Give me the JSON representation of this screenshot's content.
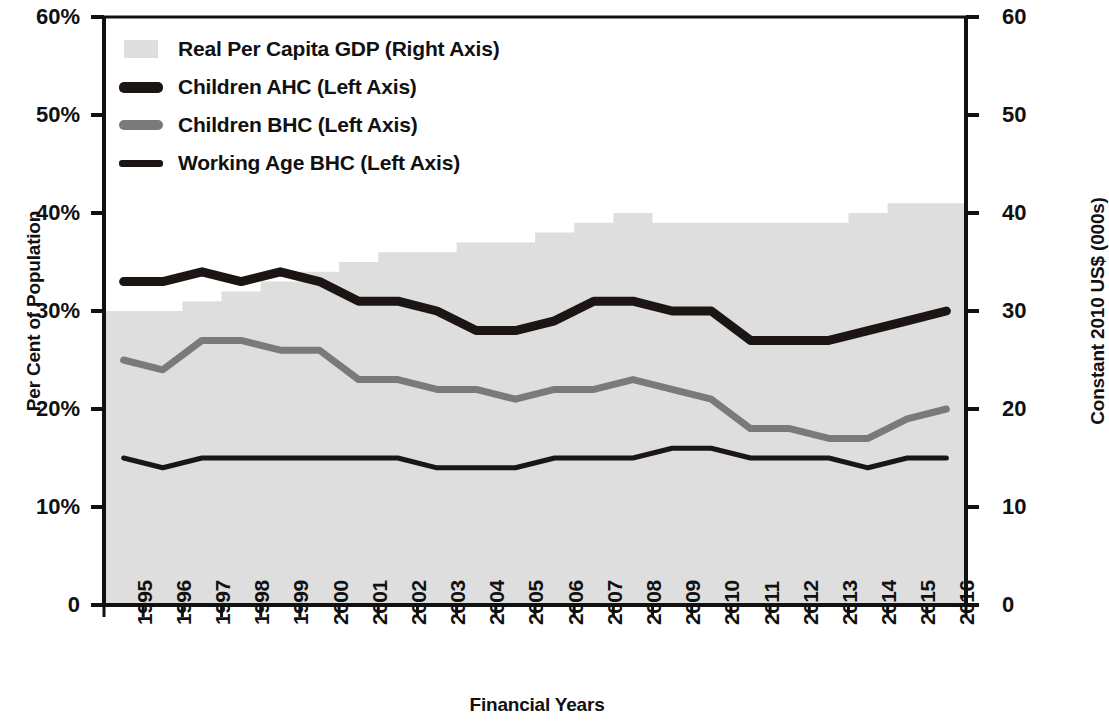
{
  "chart_data": {
    "type": "line",
    "title": "",
    "xlabel": "Financial Years",
    "ylabel": "Per Cent of Population",
    "y2label": "Constant 2010 US$ (000s)",
    "ylim": [
      0,
      60
    ],
    "y2lim": [
      0,
      60
    ],
    "grid": false,
    "legend_position": "top-left",
    "y_ticks": [
      "0",
      "10%",
      "20%",
      "30%",
      "40%",
      "50%",
      "60%"
    ],
    "y_tick_values": [
      0,
      10,
      20,
      30,
      40,
      50,
      60
    ],
    "y2_ticks": [
      "0",
      "10",
      "20",
      "30",
      "40",
      "50",
      "60"
    ],
    "y2_tick_values": [
      0,
      10,
      20,
      30,
      40,
      50,
      60
    ],
    "categories": [
      "1995",
      "1996",
      "1997",
      "1998",
      "1999",
      "2000",
      "2001",
      "2002",
      "2003",
      "2004",
      "2005",
      "2006",
      "2007",
      "2008",
      "2009",
      "2010",
      "2011",
      "2012",
      "2013",
      "2014",
      "2015",
      "2016"
    ],
    "series": [
      {
        "name": "Real Per Capita GDP (Right Axis)",
        "axis": "right",
        "render": "area-step",
        "color": "#dedede",
        "values": [
          30,
          30,
          31,
          32,
          33,
          34,
          35,
          36,
          36,
          37,
          37,
          38,
          39,
          40,
          39,
          39,
          39,
          39,
          39,
          40,
          41,
          41
        ]
      },
      {
        "name": "Children AHC (Left Axis)",
        "axis": "left",
        "render": "line",
        "color": "#1b1613",
        "width": 9,
        "values": [
          33,
          33,
          34,
          33,
          34,
          33,
          31,
          31,
          30,
          28,
          28,
          29,
          31,
          31,
          30,
          30,
          27,
          27,
          27,
          28,
          29,
          30
        ]
      },
      {
        "name": "Children BHC (Left Axis)",
        "axis": "left",
        "render": "line",
        "color": "#7a7a7a",
        "width": 7,
        "values": [
          25,
          24,
          27,
          27,
          26,
          26,
          23,
          23,
          22,
          22,
          21,
          22,
          22,
          23,
          22,
          21,
          18,
          18,
          17,
          17,
          19,
          20
        ]
      },
      {
        "name": "Working Age BHC (Left Axis)",
        "axis": "left",
        "render": "line",
        "color": "#1b1613",
        "width": 5,
        "values": [
          15,
          14,
          15,
          15,
          15,
          15,
          15,
          15,
          14,
          14,
          14,
          15,
          15,
          15,
          16,
          16,
          15,
          15,
          15,
          14,
          15,
          15
        ]
      }
    ]
  },
  "legend": {
    "items": [
      {
        "label": "Real Per Capita GDP (Right Axis)",
        "swatch": "area-swatch"
      },
      {
        "label": "Children AHC (Left Axis)",
        "swatch": "thick-line-swatch"
      },
      {
        "label": "Children BHC (Left Axis)",
        "swatch": "mid-line-swatch"
      },
      {
        "label": "Working Age BHC (Left Axis)",
        "swatch": "thin-line-swatch"
      }
    ]
  },
  "axes": {
    "left_title": "Per Cent of Population",
    "right_title": "Constant 2010 US$ (000s)",
    "bottom_title": "Financial Years"
  },
  "colors": {
    "area": "#dedede",
    "dark_line": "#1b1613",
    "gray_line": "#7a7a7a",
    "axis": "#111111"
  }
}
